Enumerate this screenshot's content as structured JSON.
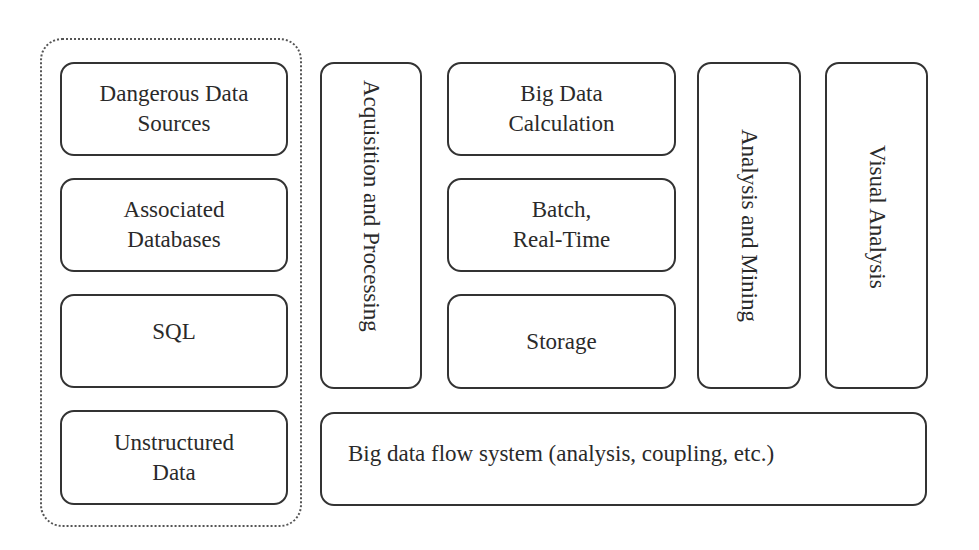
{
  "diagram": {
    "source_group": {
      "items": [
        {
          "line1": "Dangerous Data",
          "line2": "Sources"
        },
        {
          "line1": "Associated",
          "line2": "Databases"
        },
        {
          "line1": "SQL",
          "line2": ""
        },
        {
          "line1": "Unstructured",
          "line2": "Data"
        }
      ]
    },
    "acquisition": {
      "label": "Acquisition and Processing"
    },
    "compute_column": {
      "items": [
        {
          "line1": "Big Data",
          "line2": "Calculation"
        },
        {
          "line1": "Batch,",
          "line2": "Real-Time"
        },
        {
          "line1": "Storage",
          "line2": ""
        }
      ]
    },
    "analysis_mining": {
      "label": "Analysis and Mining"
    },
    "visual_analysis": {
      "label": "Visual Analysis"
    },
    "flow_system": {
      "label": "Big data flow system (analysis, coupling, etc.)"
    },
    "colors": {
      "stroke": "#333333",
      "text": "#2a2a2a",
      "background": "#ffffff"
    }
  }
}
